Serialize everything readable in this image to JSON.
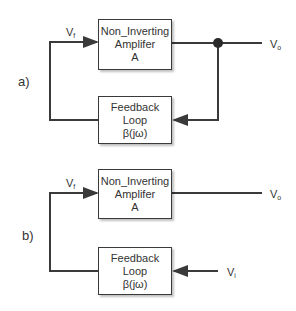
{
  "panels": [
    {
      "label": "a)",
      "amplifier": {
        "line1": "Non_Inverting",
        "line2": "Amplifer",
        "line3": "A"
      },
      "feedback": {
        "line1": "Feedback",
        "line2": "Loop",
        "line3": "β(jω)"
      },
      "vf": {
        "main": "V",
        "sub": "f"
      },
      "vo": {
        "main": "V",
        "sub": "o"
      }
    },
    {
      "label": "b)",
      "amplifier": {
        "line1": "Non_Inverting",
        "line2": "Amplifer",
        "line3": "A"
      },
      "feedback": {
        "line1": "Feedback",
        "line2": "Loop",
        "line3": "β(jω)"
      },
      "vf": {
        "main": "V",
        "sub": "f"
      },
      "vo": {
        "main": "V",
        "sub": "o"
      },
      "vi": {
        "main": "V",
        "sub": "i"
      }
    }
  ],
  "colors": {
    "line": "#3a3a3a",
    "box_border": "#3a3a3a",
    "text": "#333333"
  }
}
